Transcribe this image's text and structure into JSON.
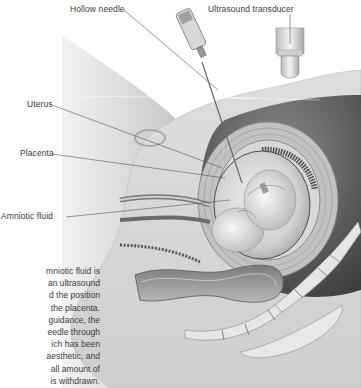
{
  "diagram": {
    "labels": {
      "hollow_needle": "Hollow needle",
      "ultrasound_transducer": "Ultrasound transducer",
      "uterus": "Uterus",
      "placenta": "Placenta",
      "amniotic_fluid": "Amniotic fluid"
    },
    "caption_lines": [
      "mniotic fluid is",
      "an ultrasound",
      "d the position",
      "the placenta.",
      "guidance, the",
      "eedle through",
      "ich has been",
      "aesthetic, and",
      "all amount of",
      "is withdrawn."
    ],
    "colors": {
      "background": "#ffffff",
      "tissue_light": "#e2e2e2",
      "tissue_mid": "#c4c4c4",
      "tissue_dark": "#5a5a5a",
      "label_text": "#3a3a3a",
      "leader_line": "#555555"
    }
  }
}
